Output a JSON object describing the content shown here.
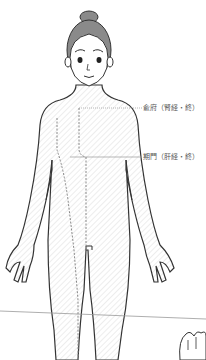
{
  "diagram": {
    "colors": {
      "outline": "#333333",
      "hair": "#8a8a8a",
      "hatch": "#d8d8d8",
      "meridian": "#888888",
      "leader": "#999999",
      "label": "#555555"
    },
    "annotations": [
      {
        "id": "shufu",
        "text": "兪府（腎経・終）",
        "x": 143,
        "y": 104
      },
      {
        "id": "qimen",
        "text": "期門（肝経・終）",
        "x": 143,
        "y": 152
      }
    ]
  }
}
